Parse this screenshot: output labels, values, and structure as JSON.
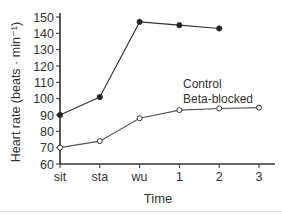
{
  "chart_data": {
    "type": "line",
    "title": "",
    "xlabel": "Time",
    "ylabel": "Heart rate (beats · min⁻¹)",
    "ylim": [
      60,
      150
    ],
    "yticks": [
      60,
      70,
      80,
      90,
      100,
      110,
      120,
      130,
      140,
      150
    ],
    "categories": [
      "sit",
      "sta",
      "wu",
      "1",
      "2",
      "3"
    ],
    "grid": false,
    "legend_position": "inside-right",
    "series": [
      {
        "name": "Control",
        "marker": "filled-circle",
        "color": "#333333",
        "values": [
          90,
          101,
          147,
          145,
          143,
          null
        ]
      },
      {
        "name": "Beta-blocked",
        "marker": "open-circle",
        "color": "#555555",
        "values": [
          70,
          74,
          88,
          93,
          94,
          94.5
        ]
      }
    ]
  },
  "legend": {
    "line1": "Control",
    "line2": "Beta-blocked"
  }
}
